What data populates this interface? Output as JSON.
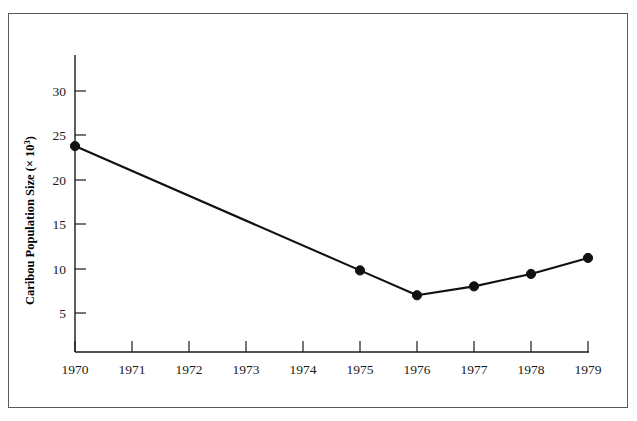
{
  "chart_data": {
    "type": "line",
    "title": "",
    "xlabel": "",
    "ylabel": "Caribou Population Size (× 10",
    "ylabel_exponent": "3",
    "ylabel_suffix": ")",
    "x": [
      1970,
      1971,
      1972,
      1973,
      1974,
      1975,
      1976,
      1977,
      1978,
      1979
    ],
    "xtick_labels": [
      "1970",
      "1971",
      "1972",
      "1973",
      "1974",
      "1975",
      "1976",
      "1977",
      "1978",
      "1979"
    ],
    "ytick_labels": [
      "5",
      "10",
      "15",
      "20",
      "25",
      "30"
    ],
    "yticks": [
      5,
      10,
      15,
      20,
      25,
      30
    ],
    "xlim": [
      1970,
      1979
    ],
    "ylim": [
      0,
      32
    ],
    "grid": false,
    "legend": null,
    "series": [
      {
        "name": "Caribou population",
        "points": [
          {
            "x": 1970,
            "y": 23.8
          },
          {
            "x": 1975,
            "y": 9.8
          },
          {
            "x": 1976,
            "y": 7.0
          },
          {
            "x": 1977,
            "y": 8.0
          },
          {
            "x": 1978,
            "y": 9.4
          },
          {
            "x": 1979,
            "y": 11.2
          }
        ],
        "marker": "filled-circle",
        "line_color": "#111111",
        "marker_color": "#111111"
      }
    ]
  },
  "figure": {
    "border_color": "#5a5a5a",
    "background_color": "#ffffff"
  }
}
